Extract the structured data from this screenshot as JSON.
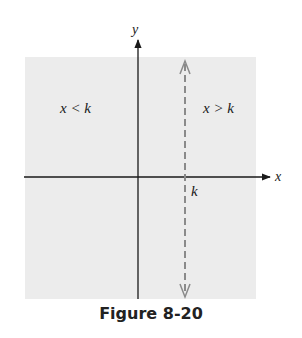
{
  "figure": {
    "caption": "Figure 8-20",
    "axis_labels": {
      "x": "x",
      "y": "y"
    },
    "region_labels": {
      "left": "x < k",
      "right": "x > k"
    },
    "line_label": "k",
    "colors": {
      "shading": "#ececec",
      "axis": "#1a1a1a",
      "dashed_line": "#8a8a8a"
    }
  }
}
